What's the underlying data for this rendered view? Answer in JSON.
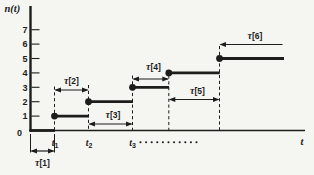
{
  "colors": {
    "background": "#f5f5f2",
    "ink": "#1d1d1b"
  },
  "chart_data": {
    "type": "line",
    "subtype": "step-function-counting-process",
    "title": "",
    "ylabel": "n(t)",
    "xlabel": "t",
    "origin_label": "0",
    "y_ticks": [
      1,
      2,
      3,
      4,
      5,
      6,
      7
    ],
    "ylim": [
      0,
      7
    ],
    "grid": false,
    "arrivals": [
      {
        "main": "t",
        "sub": "1",
        "x": 55
      },
      {
        "main": "t",
        "sub": "2",
        "x": 89
      },
      {
        "main": "t",
        "sub": "3",
        "x": 132.5
      }
    ],
    "steps": [
      {
        "level": 0,
        "x1": 29.5,
        "x2": 55,
        "dot": false
      },
      {
        "level": 1,
        "x1": 54.5,
        "x2": 89,
        "dot": true
      },
      {
        "level": 2,
        "x1": 88.5,
        "x2": 133,
        "dot": true
      },
      {
        "level": 3,
        "x1": 132.5,
        "x2": 169,
        "dot": true
      },
      {
        "level": 4,
        "x1": 168.8,
        "x2": 219.8,
        "dot": true
      },
      {
        "level": 5,
        "x1": 219.5,
        "x2": 284,
        "dot": true
      }
    ],
    "intervals": [
      {
        "label": "τ[1]",
        "x1": 30.5,
        "x2": 54.5,
        "y": 151,
        "heads": "both",
        "label_x": 42.5,
        "label_y": 166
      },
      {
        "label": "τ[2]",
        "x1": 54.5,
        "x2": 88.5,
        "y": 90,
        "heads": "both",
        "label_x": 71.5,
        "label_y": 84
      },
      {
        "label": "τ[3]",
        "x1": 88.5,
        "x2": 132.5,
        "y": 124,
        "heads": "both",
        "label_x": 113,
        "label_y": 117.5
      },
      {
        "label": "τ[4]",
        "x1": 132.5,
        "x2": 168.8,
        "y": 79,
        "heads": "both",
        "label_x": 153.5,
        "label_y": 70
      },
      {
        "label": "τ[5]",
        "x1": 168.8,
        "x2": 219.5,
        "y": 99.5,
        "heads": "both",
        "label_x": 197.5,
        "label_y": 93.5
      },
      {
        "label": "τ[6]",
        "x1": 219.5,
        "x2": 283.5,
        "y": 44.5,
        "heads": "left",
        "label_x": 255,
        "label_y": 39
      }
    ],
    "layout_px": {
      "axis_x": 30.5,
      "axis_top": 6,
      "baseline": 130.5,
      "x_axis_right": 305,
      "unit_h": 14.4,
      "tick_x2": 39.5,
      "ytick_label_x": 27.5,
      "ytick_font": 9,
      "origin": {
        "x": 19.5,
        "y": 135.5
      },
      "ylabel_pos": {
        "x": 4.5,
        "y": 11.5
      },
      "xlabel_pos": {
        "x": 300.5,
        "y": 144.5
      },
      "arrival_label_y": 145.5,
      "dot_r": 3.4,
      "step_stroke": 2.8,
      "guides": [
        {
          "x": 54.5,
          "y1": 86.5,
          "y2": 130.5
        },
        {
          "x": 88.5,
          "y1": 85,
          "y2": 130.5
        },
        {
          "x": 132.5,
          "y1": 75.5,
          "y2": 130.5
        },
        {
          "x": 168.8,
          "y1": 75.5,
          "y2": 130.5
        },
        {
          "x": 219.5,
          "y1": 46,
          "y2": 130.5
        }
      ],
      "stubs": [
        {
          "x": 30.5,
          "y1": 134,
          "y2": 152.5
        },
        {
          "x": 54.5,
          "y1": 134,
          "y2": 152.5
        }
      ],
      "ellipsis": {
        "x_start": 140.5,
        "step": 5.6,
        "count": 11,
        "y": 142.3,
        "r": 1.05
      }
    }
  }
}
